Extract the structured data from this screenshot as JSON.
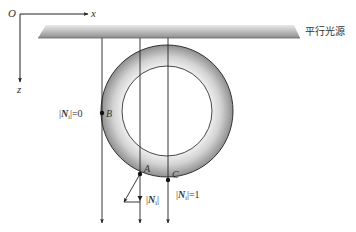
{
  "figure": {
    "axes": {
      "origin_label": "O",
      "x_label": "x",
      "z_label": "z"
    },
    "light_source": {
      "label": "平行光源"
    },
    "points": [
      {
        "name": "B",
        "note": "|N_i|=0"
      },
      {
        "name": "A",
        "note": "|N_i|"
      },
      {
        "name": "C",
        "note": "|N|=1"
      }
    ],
    "labels": {
      "point_b": "B",
      "point_a": "A",
      "point_c": "C",
      "b_norm_prefix": "|",
      "b_norm_var": "N",
      "b_norm_sub": "i",
      "b_norm_suffix": "|=0",
      "a_norm_prefix": "|",
      "a_norm_var": "N",
      "a_norm_sub": "i",
      "a_norm_suffix": "|",
      "c_norm_prefix": "|",
      "c_norm_var": "N",
      "c_norm_sub": "i",
      "c_norm_suffix": "|=1"
    },
    "colors": {
      "stroke": "#222222",
      "ring_dark": "#8a8a8a",
      "ring_light": "#f2f2f2",
      "bar_dark": "#8c8c8c",
      "bar_light": "#e6e6e6"
    }
  }
}
